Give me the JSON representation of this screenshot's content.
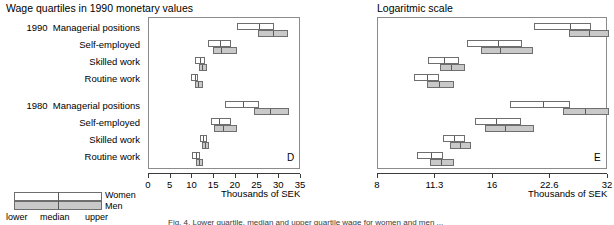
{
  "figure": {
    "caption_fragment": "Fig. 4. Lower quartile, median and upper quartile wage for women and men ..."
  },
  "legend": {
    "women_label": "Women",
    "men_label": "Men",
    "lower_label": "lower",
    "median_label": "median",
    "upper_label": "upper",
    "colors": {
      "women": "#ffffff",
      "men": "#c9c9c9",
      "outline": "#6e6e6e"
    }
  },
  "row_labels": {
    "year_1990": "1990",
    "year_1980": "1980",
    "managerial": "Managerial positions",
    "self_employed": "Self-employed",
    "skilled": "Skilled work",
    "routine": "Routine work"
  },
  "panels": [
    {
      "id": "D",
      "label": "D",
      "title": "Wage quartiles in 1990 monetary values",
      "axis_title": "Thousands of SEK"
    },
    {
      "id": "E",
      "label": "E",
      "title": "Logaritmic scale",
      "axis_title": "Thousands of SEK"
    }
  ],
  "chart_data": [
    {
      "type": "bar",
      "id": "D",
      "title": "Wage quartiles in 1990 monetary values",
      "xlabel": "Thousands of SEK",
      "ylabel": "",
      "scale": "linear",
      "xlim": [
        0,
        35
      ],
      "xticks": [
        0,
        5,
        10,
        15,
        20,
        25,
        30,
        35
      ],
      "xticklabels": [
        "0",
        "5",
        "10",
        "15",
        "20",
        "25",
        "30",
        "35"
      ],
      "grid": false,
      "legend": "none",
      "categories": [
        "1990 Managerial positions",
        "1990 Self-employed",
        "1990 Skilled work",
        "1990 Routine work",
        "1980 Managerial positions",
        "1980 Self-employed",
        "1980 Skilled work",
        "1980 Routine work"
      ],
      "series": [
        {
          "name": "Women",
          "quartiles": [
            {
              "lower": 20.6,
              "median": 25.6,
              "upper": 29.1
            },
            {
              "lower": 13.8,
              "median": 16.6,
              "upper": 19.2
            },
            {
              "lower": 10.9,
              "median": 12.0,
              "upper": 13.1
            },
            {
              "lower": 10.0,
              "median": 10.8,
              "upper": 11.6
            }
          ]
        },
        {
          "name": "Men",
          "quartiles": [
            {
              "lower": 25.4,
              "median": 28.7,
              "upper": 32.3
            },
            {
              "lower": 15.0,
              "median": 16.8,
              "upper": 20.5
            },
            {
              "lower": 11.7,
              "median": 12.5,
              "upper": 13.6
            },
            {
              "lower": 10.8,
              "median": 11.6,
              "upper": 12.7
            }
          ]
        }
      ],
      "series_1980": [
        {
          "name": "Women",
          "quartiles": [
            {
              "lower": 17.8,
              "median": 21.8,
              "upper": 25.6
            },
            {
              "lower": 14.4,
              "median": 16.4,
              "upper": 19.0
            },
            {
              "lower": 11.9,
              "median": 12.7,
              "upper": 13.6
            },
            {
              "lower": 10.2,
              "median": 11.1,
              "upper": 11.9
            }
          ]
        },
        {
          "name": "Men",
          "quartiles": [
            {
              "lower": 24.5,
              "median": 28.0,
              "upper": 32.4
            },
            {
              "lower": 15.3,
              "median": 17.3,
              "upper": 20.6
            },
            {
              "lower": 12.4,
              "median": 13.2,
              "upper": 14.1
            },
            {
              "lower": 11.0,
              "median": 11.8,
              "upper": 12.7
            }
          ]
        }
      ]
    },
    {
      "type": "bar",
      "id": "E",
      "title": "Logaritmic scale",
      "xlabel": "Thousands of SEK",
      "ylabel": "",
      "scale": "log",
      "xlim": [
        8,
        32
      ],
      "xticks": [
        8,
        11.3,
        16,
        22.6,
        32
      ],
      "xticklabels": [
        "8",
        "11.3",
        "16",
        "22.6",
        "32"
      ],
      "grid": false,
      "legend": "none",
      "categories": [
        "1990 Managerial positions",
        "1990 Self-employed",
        "1990 Skilled work",
        "1990 Routine work",
        "1980 Managerial positions",
        "1980 Self-employed",
        "1980 Skilled work",
        "1980 Routine work"
      ],
      "series": [
        {
          "name": "Women",
          "quartiles": [
            {
              "lower": 20.6,
              "median": 25.6,
              "upper": 29.1
            },
            {
              "lower": 13.8,
              "median": 16.6,
              "upper": 19.2
            },
            {
              "lower": 10.9,
              "median": 12.0,
              "upper": 13.1
            },
            {
              "lower": 10.0,
              "median": 10.8,
              "upper": 11.6
            }
          ]
        },
        {
          "name": "Men",
          "quartiles": [
            {
              "lower": 25.4,
              "median": 28.7,
              "upper": 32.3
            },
            {
              "lower": 15.0,
              "median": 16.8,
              "upper": 20.5
            },
            {
              "lower": 11.7,
              "median": 12.5,
              "upper": 13.6
            },
            {
              "lower": 10.8,
              "median": 11.6,
              "upper": 12.7
            }
          ]
        }
      ],
      "series_1980": [
        {
          "name": "Women",
          "quartiles": [
            {
              "lower": 17.8,
              "median": 21.8,
              "upper": 25.6
            },
            {
              "lower": 14.4,
              "median": 16.4,
              "upper": 19.0
            },
            {
              "lower": 11.9,
              "median": 12.7,
              "upper": 13.6
            },
            {
              "lower": 10.2,
              "median": 11.1,
              "upper": 11.9
            }
          ]
        },
        {
          "name": "Men",
          "quartiles": [
            {
              "lower": 24.5,
              "median": 28.0,
              "upper": 32.4
            },
            {
              "lower": 15.3,
              "median": 17.3,
              "upper": 20.6
            },
            {
              "lower": 12.4,
              "median": 13.2,
              "upper": 14.1
            },
            {
              "lower": 11.0,
              "median": 11.8,
              "upper": 12.7
            }
          ]
        }
      ]
    }
  ]
}
